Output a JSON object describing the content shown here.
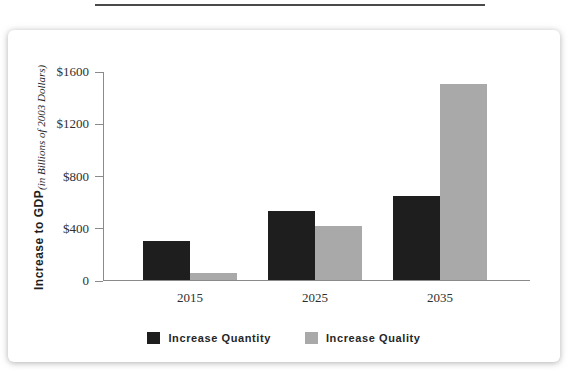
{
  "decor": {
    "top_rule_color": "#4a4a4a"
  },
  "chart_data": {
    "type": "bar",
    "title": "",
    "xlabel": "",
    "ylabel": "Increase to GDP",
    "ylabel_note": "(in Billions of 2003 Dollars)",
    "categories": [
      "2015",
      "2025",
      "2035"
    ],
    "series": [
      {
        "name": "Increase Quantity",
        "color": "#1e1e1e",
        "values": [
          300,
          525,
          640
        ]
      },
      {
        "name": "Increase Quality",
        "color": "#a9a9a9",
        "values": [
          50,
          410,
          1500
        ]
      }
    ],
    "ylim": [
      0,
      1600
    ],
    "ytick_values": [
      0,
      400,
      800,
      1200,
      1600
    ],
    "ytick_labels": [
      "0",
      "$400",
      "$800",
      "$1200",
      "$1600"
    ],
    "grid": false,
    "legend_position": "bottom",
    "axis_color": "#8a8a8a"
  }
}
